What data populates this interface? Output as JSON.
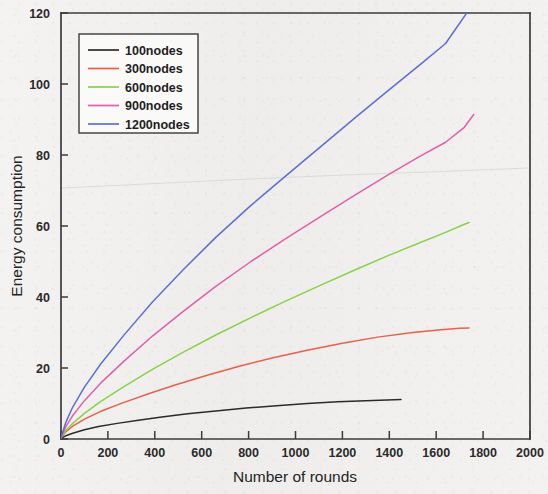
{
  "chart_data": {
    "type": "line",
    "title": "",
    "xlabel": "Number of rounds",
    "ylabel": "Energy consumption",
    "xlim": [
      0,
      2000
    ],
    "ylim": [
      0,
      120
    ],
    "xticks": [
      0,
      200,
      400,
      600,
      800,
      1000,
      1200,
      1400,
      1600,
      1800,
      2000
    ],
    "yticks": [
      0,
      20,
      40,
      60,
      80,
      100,
      120
    ],
    "grid": false,
    "legend_position": "upper-left",
    "series": [
      {
        "name": "100nodes",
        "color": "#2b2b2b",
        "x": [
          0,
          20,
          50,
          100,
          160,
          240,
          330,
          430,
          540,
          660,
          790,
          920,
          1050,
          1180,
          1300,
          1390,
          1450
        ],
        "values": [
          0.2,
          0.9,
          1.6,
          2.6,
          3.5,
          4.4,
          5.3,
          6.2,
          7.1,
          7.9,
          8.7,
          9.4,
          10.0,
          10.5,
          10.8,
          11.0,
          11.1
        ]
      },
      {
        "name": "300nodes",
        "color": "#e8604c",
        "x": [
          0,
          20,
          50,
          100,
          170,
          260,
          370,
          490,
          620,
          760,
          900,
          1050,
          1200,
          1350,
          1500,
          1620,
          1700,
          1740
        ],
        "values": [
          0.3,
          2.0,
          3.6,
          5.6,
          7.8,
          10.1,
          12.7,
          15.3,
          17.9,
          20.5,
          22.8,
          25.0,
          27.0,
          28.7,
          30.0,
          30.8,
          31.2,
          31.3
        ]
      },
      {
        "name": "600nodes",
        "color": "#86d24a",
        "x": [
          0,
          20,
          50,
          100,
          170,
          270,
          390,
          520,
          660,
          810,
          960,
          1110,
          1260,
          1400,
          1530,
          1640,
          1710,
          1740
        ],
        "values": [
          0.3,
          2.4,
          4.4,
          7.2,
          10.6,
          14.8,
          19.6,
          24.4,
          29.3,
          34.2,
          38.9,
          43.4,
          47.8,
          51.8,
          55.3,
          58.2,
          60.2,
          61.0
        ]
      },
      {
        "name": "900nodes",
        "color": "#e05fa8",
        "x": [
          0,
          20,
          50,
          100,
          170,
          270,
          390,
          520,
          660,
          810,
          960,
          1110,
          1260,
          1400,
          1530,
          1640,
          1720,
          1760
        ],
        "values": [
          0.3,
          3.4,
          6.6,
          10.8,
          15.8,
          22.0,
          29.0,
          35.9,
          43.0,
          50.0,
          56.5,
          62.8,
          69.0,
          74.6,
          79.6,
          83.6,
          87.8,
          91.4
        ]
      },
      {
        "name": "1200nodes",
        "color": "#5b6fd1",
        "x": [
          0,
          20,
          50,
          100,
          170,
          270,
          390,
          520,
          660,
          810,
          960,
          1110,
          1260,
          1400,
          1530,
          1640,
          1730
        ],
        "values": [
          0.4,
          4.6,
          9.0,
          14.6,
          21.2,
          29.4,
          38.6,
          47.6,
          56.8,
          65.8,
          74.2,
          82.5,
          90.8,
          98.4,
          105.4,
          111.4,
          120.0
        ]
      }
    ]
  },
  "legend": {
    "items": [
      {
        "label": "100nodes"
      },
      {
        "label": "300nodes"
      },
      {
        "label": "600nodes"
      },
      {
        "label": "900nodes"
      },
      {
        "label": "1200nodes"
      }
    ]
  }
}
